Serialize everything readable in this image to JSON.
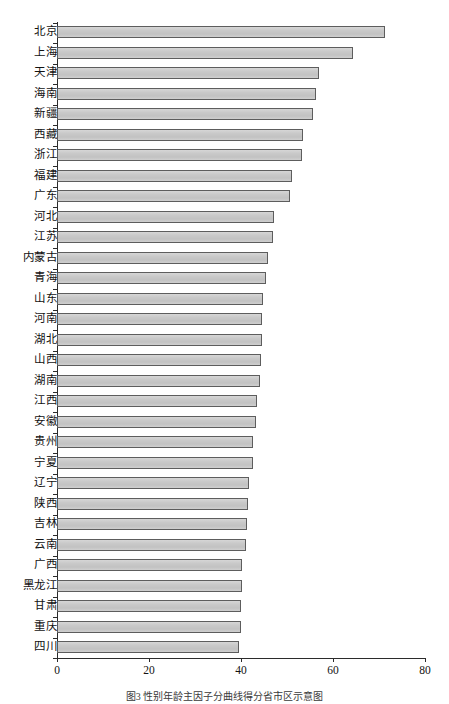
{
  "figure": {
    "caption": "图3  性别年龄主因子分曲线得分省市区示意图",
    "background_color": "#ffffff",
    "bar_fill_color": "#c9c9c9",
    "bar_border_color": "#5d5d5d",
    "axis_color": "#2b2b2b"
  },
  "chart_data": {
    "type": "bar",
    "orientation": "horizontal",
    "title": "",
    "subtitle": "",
    "xlabel": "",
    "ylabel": "",
    "xlim": [
      0,
      80
    ],
    "ylim": null,
    "grid": false,
    "legend": null,
    "xticks": [
      "0",
      "20",
      "40",
      "60",
      "80"
    ],
    "xtick_values": [
      0,
      20,
      40,
      60,
      80
    ],
    "categories": [
      "北京",
      "上海",
      "天津",
      "海南",
      "新疆",
      "西藏",
      "浙江",
      "福建",
      "广东",
      "河北",
      "江苏",
      "内蒙古",
      "青海",
      "山东",
      "河南",
      "湖北",
      "山西",
      "湖南",
      "江西",
      "安徽",
      "贵州",
      "宁夏",
      "辽宁",
      "陕西",
      "吉林",
      "云南",
      "广西",
      "黑龙江",
      "甘肃",
      "重庆",
      "四川"
    ],
    "values": [
      71.3,
      64.4,
      57.0,
      56.2,
      55.6,
      53.5,
      53.2,
      51.0,
      50.6,
      47.2,
      46.9,
      45.9,
      45.4,
      44.8,
      44.6,
      44.5,
      44.3,
      44.2,
      43.5,
      43.3,
      42.7,
      42.5,
      41.8,
      41.6,
      41.3,
      41.0,
      40.3,
      40.2,
      40.1,
      40.0,
      39.6
    ]
  }
}
